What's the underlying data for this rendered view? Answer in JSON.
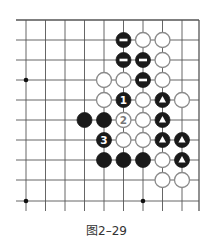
{
  "figure": {
    "caption": "图2–29",
    "type": "go-board-diagram"
  },
  "board": {
    "columns_x": [
      26,
      45.5,
      65,
      84.5,
      104,
      123.5,
      143,
      162.5,
      182,
      199
    ],
    "rows_y": [
      20,
      40,
      60,
      80,
      100,
      120,
      140,
      160,
      180,
      201
    ],
    "line_extend_left": 10,
    "line_extend_bottom": 10,
    "line_color": "#555555",
    "stone_radius": 7.5,
    "star_points": [
      [
        0,
        3
      ],
      [
        0,
        9
      ],
      [
        6,
        9
      ]
    ],
    "stones": [
      {
        "col": 5,
        "row": 1,
        "color": "black",
        "mark": "minus"
      },
      {
        "col": 6,
        "row": 1,
        "color": "white"
      },
      {
        "col": 7,
        "row": 1,
        "color": "white"
      },
      {
        "col": 5,
        "row": 2,
        "color": "black",
        "mark": "minus"
      },
      {
        "col": 6,
        "row": 2,
        "color": "black",
        "mark": "minus"
      },
      {
        "col": 7,
        "row": 2,
        "color": "white"
      },
      {
        "col": 4,
        "row": 3,
        "color": "white"
      },
      {
        "col": 5,
        "row": 3,
        "color": "white"
      },
      {
        "col": 6,
        "row": 3,
        "color": "black",
        "mark": "minus"
      },
      {
        "col": 7,
        "row": 3,
        "color": "white"
      },
      {
        "col": 4,
        "row": 4,
        "color": "white"
      },
      {
        "col": 5,
        "row": 4,
        "color": "black",
        "label": "1"
      },
      {
        "col": 6,
        "row": 4,
        "color": "white"
      },
      {
        "col": 7,
        "row": 4,
        "color": "black",
        "mark": "triangle"
      },
      {
        "col": 8,
        "row": 4,
        "color": "white"
      },
      {
        "col": 3,
        "row": 5,
        "color": "black"
      },
      {
        "col": 4,
        "row": 5,
        "color": "black"
      },
      {
        "col": 5,
        "row": 5,
        "color": "white",
        "label": "2"
      },
      {
        "col": 6,
        "row": 5,
        "color": "white"
      },
      {
        "col": 7,
        "row": 5,
        "color": "black",
        "mark": "triangle"
      },
      {
        "col": 4,
        "row": 6,
        "color": "black",
        "label": "3"
      },
      {
        "col": 5,
        "row": 6,
        "color": "white"
      },
      {
        "col": 6,
        "row": 6,
        "color": "white"
      },
      {
        "col": 7,
        "row": 6,
        "color": "black",
        "mark": "triangle"
      },
      {
        "col": 8,
        "row": 6,
        "color": "black",
        "mark": "triangle"
      },
      {
        "col": 4,
        "row": 7,
        "color": "black"
      },
      {
        "col": 5,
        "row": 7,
        "color": "black"
      },
      {
        "col": 6,
        "row": 7,
        "color": "black"
      },
      {
        "col": 7,
        "row": 7,
        "color": "white"
      },
      {
        "col": 8,
        "row": 7,
        "color": "black",
        "mark": "triangle"
      },
      {
        "col": 7,
        "row": 8,
        "color": "white"
      },
      {
        "col": 8,
        "row": 8,
        "color": "white"
      }
    ],
    "colors": {
      "black_stone": "#1a1a1a",
      "white_stone_fill": "#ffffff",
      "white_stone_stroke": "#8a8a8a",
      "mark_on_black": "#ffffff",
      "label_on_white": "#777777"
    }
  }
}
